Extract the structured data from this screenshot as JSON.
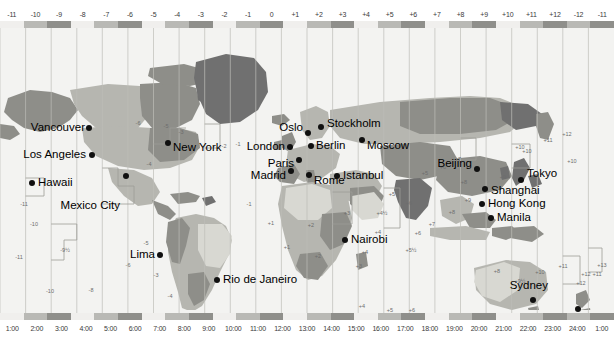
{
  "top_ruler": {
    "name": "utc-offset-ruler",
    "labels": [
      "-11",
      "-10",
      "-9",
      "-8",
      "-7",
      "-6",
      "-5",
      "-4",
      "-3",
      "-2",
      "-1",
      "0",
      "+1",
      "+2",
      "+3",
      "+4",
      "+5",
      "+6",
      "+7",
      "+8",
      "+9",
      "+10",
      "+11",
      "+12",
      "-12",
      "-11"
    ]
  },
  "bottom_ruler": {
    "name": "local-time-ruler",
    "labels": [
      "1:00",
      "2:00",
      "3:00",
      "4:00",
      "5:00",
      "6:00",
      "7:00",
      "8:00",
      "9:00",
      "10:00",
      "11:00",
      "12:00",
      "13:00",
      "14:00",
      "15:00",
      "16:00",
      "17:00",
      "18:00",
      "19:00",
      "20:00",
      "21:00",
      "22:00",
      "23:00",
      "24:00",
      "1:00"
    ]
  },
  "colors": {
    "band_light": "#f0efed",
    "band_mid": "#b9b9b5",
    "band_dark": "#8f8f8b",
    "ocean": "#f3f3f1",
    "land_light": "#d8d8d2",
    "land_mid": "#b6b6b0",
    "land_dark": "#8e8e89",
    "land_darker": "#707070",
    "marker": "#101010",
    "text": "#000000",
    "zone_line": "#d8d8d4"
  },
  "cities": [
    {
      "name": "Vancouver",
      "x": 89,
      "y": 100,
      "align": "right",
      "label_x": 85,
      "label_y": 100
    },
    {
      "name": "Los Angeles",
      "x": 92,
      "y": 127,
      "align": "right",
      "label_x": 86,
      "label_y": 127
    },
    {
      "name": "Hawaii",
      "x": 32,
      "y": 155,
      "align": "left",
      "label_x": 38,
      "label_y": 155
    },
    {
      "name": "Mexico City",
      "x": 126,
      "y": 148,
      "align": "right",
      "label_x": 120,
      "label_y": 178
    },
    {
      "name": "New York",
      "x": 168,
      "y": 115,
      "align": "left",
      "label_x": 173,
      "label_y": 120
    },
    {
      "name": "Lima",
      "x": 160,
      "y": 227,
      "align": "right",
      "label_x": 155,
      "label_y": 227
    },
    {
      "name": "Rio de Janeiro",
      "x": 217,
      "y": 252,
      "align": "left",
      "label_x": 223,
      "label_y": 252
    },
    {
      "name": "London",
      "x": 290,
      "y": 119,
      "align": "right",
      "label_x": 285,
      "label_y": 119
    },
    {
      "name": "Madrid",
      "x": 291,
      "y": 143,
      "align": "right",
      "label_x": 286,
      "label_y": 148
    },
    {
      "name": "Oslo",
      "x": 308,
      "y": 105,
      "align": "right",
      "label_x": 303,
      "label_y": 100
    },
    {
      "name": "Stockholm",
      "x": 321,
      "y": 99,
      "align": "left",
      "label_x": 327,
      "label_y": 96
    },
    {
      "name": "Paris",
      "x": 299,
      "y": 132,
      "align": "right",
      "label_x": 294,
      "label_y": 136
    },
    {
      "name": "Berlin",
      "x": 311,
      "y": 118,
      "align": "left",
      "label_x": 316,
      "label_y": 118
    },
    {
      "name": "Rome",
      "x": 309,
      "y": 147,
      "align": "left",
      "label_x": 314,
      "label_y": 153
    },
    {
      "name": "Moscow",
      "x": 362,
      "y": 112,
      "align": "left",
      "label_x": 367,
      "label_y": 118
    },
    {
      "name": "Istanbul",
      "x": 337,
      "y": 148,
      "align": "left",
      "label_x": 343,
      "label_y": 148
    },
    {
      "name": "Nairobi",
      "x": 345,
      "y": 212,
      "align": "left",
      "label_x": 351,
      "label_y": 212
    },
    {
      "name": "Beijing",
      "x": 477,
      "y": 141,
      "align": "right",
      "label_x": 472,
      "label_y": 136
    },
    {
      "name": "Shanghai",
      "x": 485,
      "y": 161,
      "align": "left",
      "label_x": 491,
      "label_y": 163
    },
    {
      "name": "Tokyo",
      "x": 521,
      "y": 152,
      "align": "left",
      "label_x": 527,
      "label_y": 146
    },
    {
      "name": "Hong Kong",
      "x": 482,
      "y": 176,
      "align": "left",
      "label_x": 488,
      "label_y": 176
    },
    {
      "name": "Manila",
      "x": 491,
      "y": 190,
      "align": "left",
      "label_x": 497,
      "label_y": 190
    },
    {
      "name": "Sydney",
      "x": 533,
      "y": 272,
      "align": "right",
      "label_x": 548,
      "label_y": 258
    },
    {
      "name": "Auckland",
      "x": 578,
      "y": 281,
      "align": "right",
      "label_x": 575,
      "label_y": 290
    }
  ],
  "zone_notes": [
    {
      "text": "-11",
      "x": 24,
      "y": 176
    },
    {
      "text": "-10",
      "x": 34,
      "y": 196
    },
    {
      "text": "-11",
      "x": 19,
      "y": 229
    },
    {
      "text": "-10",
      "x": 50,
      "y": 263
    },
    {
      "text": "-9½",
      "x": 65,
      "y": 222
    },
    {
      "text": "-8",
      "x": 91,
      "y": 262
    },
    {
      "text": "-6",
      "x": 138,
      "y": 95
    },
    {
      "text": "-5",
      "x": 166,
      "y": 98
    },
    {
      "text": "-4",
      "x": 149,
      "y": 136
    },
    {
      "text": "-3",
      "x": 181,
      "y": 104
    },
    {
      "text": "-3",
      "x": 156,
      "y": 247
    },
    {
      "text": "-4",
      "x": 170,
      "y": 268
    },
    {
      "text": "-3",
      "x": 192,
      "y": 289
    },
    {
      "text": "-2",
      "x": 224,
      "y": 118
    },
    {
      "text": "-1",
      "x": 238,
      "y": 116
    },
    {
      "text": "-1",
      "x": 249,
      "y": 176
    },
    {
      "text": "+1",
      "x": 271,
      "y": 195
    },
    {
      "text": "+2",
      "x": 311,
      "y": 197
    },
    {
      "text": "+1",
      "x": 287,
      "y": 219
    },
    {
      "text": "+2",
      "x": 318,
      "y": 228
    },
    {
      "text": "+3",
      "x": 347,
      "y": 185
    },
    {
      "text": "+3",
      "x": 359,
      "y": 238
    },
    {
      "text": "+4",
      "x": 365,
      "y": 224
    },
    {
      "text": "+4",
      "x": 378,
      "y": 204
    },
    {
      "text": "+5",
      "x": 392,
      "y": 166
    },
    {
      "text": "+6",
      "x": 409,
      "y": 175
    },
    {
      "text": "+5½",
      "x": 411,
      "y": 222
    },
    {
      "text": "+4½",
      "x": 382,
      "y": 185
    },
    {
      "text": "+6",
      "x": 418,
      "y": 205
    },
    {
      "text": "+7",
      "x": 432,
      "y": 196
    },
    {
      "text": "+8",
      "x": 452,
      "y": 184
    },
    {
      "text": "+9",
      "x": 468,
      "y": 172
    },
    {
      "text": "+5",
      "x": 425,
      "y": 145
    },
    {
      "text": "+6",
      "x": 443,
      "y": 139
    },
    {
      "text": "+7",
      "x": 458,
      "y": 131
    },
    {
      "text": "+8",
      "x": 464,
      "y": 154
    },
    {
      "text": "+9",
      "x": 503,
      "y": 149
    },
    {
      "text": "+10",
      "x": 527,
      "y": 123
    },
    {
      "text": "+10",
      "x": 520,
      "y": 119
    },
    {
      "text": "+11",
      "x": 548,
      "y": 112
    },
    {
      "text": "+12",
      "x": 567,
      "y": 106
    },
    {
      "text": "+10",
      "x": 572,
      "y": 133
    },
    {
      "text": "+9½",
      "x": 520,
      "y": 253
    },
    {
      "text": "+8",
      "x": 497,
      "y": 243
    },
    {
      "text": "+10",
      "x": 540,
      "y": 244
    },
    {
      "text": "+11",
      "x": 563,
      "y": 238
    },
    {
      "text": "+12",
      "x": 581,
      "y": 255
    },
    {
      "text": "+13",
      "x": 602,
      "y": 237
    },
    {
      "text": "+11",
      "x": 597,
      "y": 246
    },
    {
      "text": "+12",
      "x": 586,
      "y": 246
    },
    {
      "text": "+4",
      "x": 362,
      "y": 278
    },
    {
      "text": "+5",
      "x": 390,
      "y": 282
    },
    {
      "text": "+6",
      "x": 412,
      "y": 282
    },
    {
      "text": "-6",
      "x": 128,
      "y": 237
    },
    {
      "text": "-5",
      "x": 146,
      "y": 215
    }
  ]
}
